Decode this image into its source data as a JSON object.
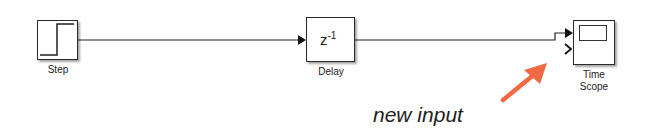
{
  "diagram": {
    "blocks": [
      {
        "id": "step",
        "label": "Step",
        "type": "source"
      },
      {
        "id": "delay",
        "label": "Delay",
        "content": "z",
        "superscript": "-1",
        "type": "discrete-delay"
      },
      {
        "id": "scope",
        "label_line1": "Time",
        "label_line2": "Scope",
        "type": "sink",
        "inputs": 2
      }
    ],
    "connections": [
      {
        "from": "Step",
        "to": "Delay"
      },
      {
        "from": "Delay",
        "to": "Time Scope (input 1)"
      }
    ],
    "annotation": {
      "text": "new input",
      "arrow_color": "#F26A45",
      "points_to": "Time Scope input 2"
    },
    "colors": {
      "line": "#222222",
      "block_border": "#2a2a2a",
      "annotation_arrow": "#F26A45"
    }
  }
}
